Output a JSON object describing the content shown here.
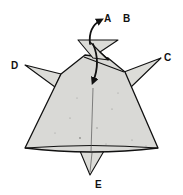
{
  "diagram": {
    "colors": {
      "paper": "#d9d9d6",
      "outline": "#111111",
      "background": "#ffffff"
    },
    "labels": {
      "a": "A",
      "b": "B",
      "c": "C",
      "d": "D",
      "e": "E"
    },
    "arrows": [
      {
        "name": "fold-up-arrow",
        "direction": "up",
        "points_to": "A"
      },
      {
        "name": "fold-down-arrow",
        "direction": "down"
      }
    ]
  }
}
